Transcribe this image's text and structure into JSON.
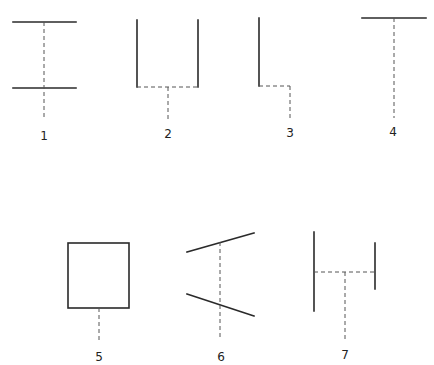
{
  "figures": [
    {
      "id": "fig1",
      "label": "1",
      "description": "two horizontal bars joined by dashed vertical axis extending below"
    },
    {
      "id": "fig2",
      "label": "2",
      "description": "U shape with solid sides and dashed bottom, dashed stem below"
    },
    {
      "id": "fig3",
      "label": "3",
      "description": "solid vertical with dashed horizontal foot stepping right then dashed down"
    },
    {
      "id": "fig4",
      "label": "4",
      "description": "horizontal top bar with dashed vertical stem (T shape)"
    },
    {
      "id": "fig5",
      "label": "5",
      "description": "square with dashed stem below"
    },
    {
      "id": "fig6",
      "label": "6",
      "description": "two diverging slanted lines crossed by dashed vertical axis"
    },
    {
      "id": "fig7",
      "label": "7",
      "description": "tall left vertical and shorter right vertical joined by dashed horizontal, dashed stem below"
    }
  ],
  "colors": {
    "solid_line": "#2a2a2a",
    "dashed_line": "#555555",
    "label_text": "#222222",
    "background": "#ffffff"
  }
}
